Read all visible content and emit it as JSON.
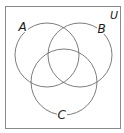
{
  "diagram": {
    "type": "venn",
    "universe": {
      "label": "U",
      "box": {
        "x": 5.5,
        "y": 6.5,
        "w": 115,
        "h": 122
      }
    },
    "sets": [
      {
        "label": "A",
        "cx": 47,
        "cy": 55,
        "r": 32,
        "label_x": 23,
        "label_y": 30
      },
      {
        "label": "B",
        "cx": 80,
        "cy": 55,
        "r": 32,
        "label_x": 102,
        "label_y": 33
      },
      {
        "label": "C",
        "cx": 64,
        "cy": 82,
        "r": 33,
        "label_x": 62,
        "label_y": 118
      }
    ],
    "colors": {
      "circle_stroke": "#6e6e6e",
      "box_stroke": "#8a8a8a",
      "text": "#1a1a1a",
      "background": "#ffffff"
    }
  }
}
